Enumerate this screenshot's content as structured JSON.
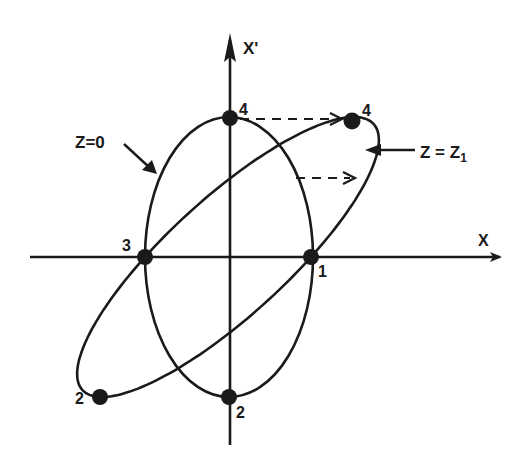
{
  "diagram": {
    "axes": {
      "x_label": "X",
      "y_label": "X'"
    },
    "curves": [
      {
        "id": "ellipse-z0",
        "label": "Z=0",
        "description": "upright ellipse"
      },
      {
        "id": "ellipse-z1",
        "label_main": "Z = Z",
        "label_sub": "1",
        "description": "sheared ellipse"
      }
    ],
    "points": [
      {
        "label": "1",
        "curve": "both",
        "position": "positive X-axis crossing"
      },
      {
        "label": "2",
        "curve": "Z=0",
        "position": "bottom of upright ellipse"
      },
      {
        "label": "3",
        "curve": "both",
        "position": "negative X-axis crossing"
      },
      {
        "label": "4",
        "curve": "Z=0",
        "position": "top of upright ellipse"
      },
      {
        "label": "4",
        "curve": "Z=Z1",
        "position": "upper-right of sheared ellipse"
      },
      {
        "label": "2",
        "curve": "Z=Z1",
        "position": "lower-left of sheared ellipse"
      }
    ],
    "annotations": {
      "z0_label": "Z=0",
      "z1_label_main": "Z = Z",
      "z1_label_sub": "1",
      "dashed_arrows": 2
    },
    "colors": {
      "ink": "#1a1a1a",
      "background": "#ffffff"
    }
  }
}
